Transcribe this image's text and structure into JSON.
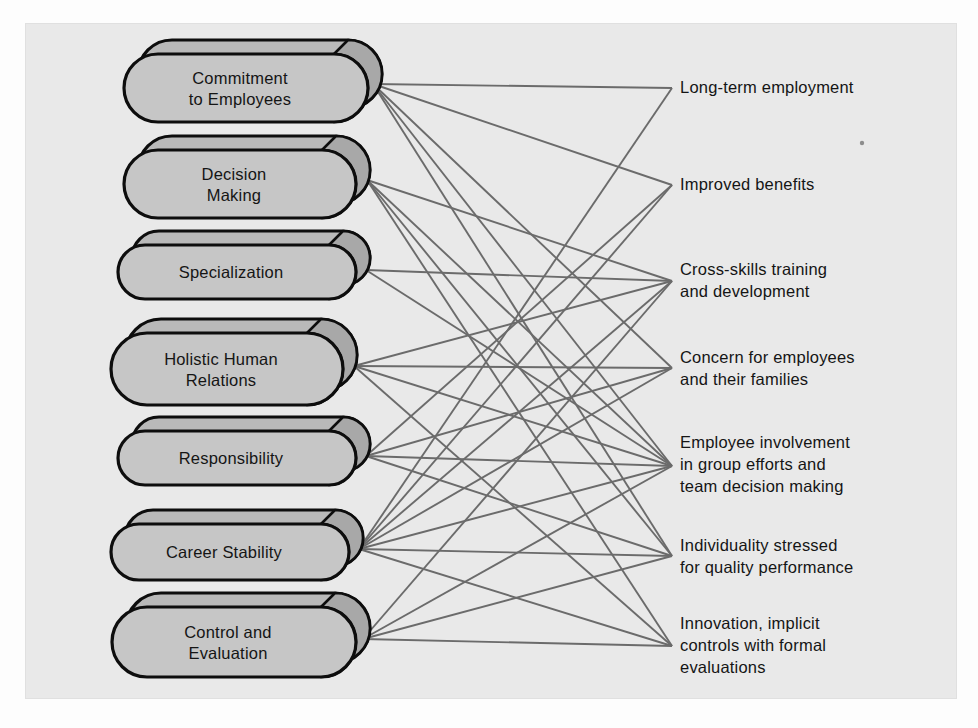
{
  "figure": {
    "panel_background": "#e9e9e9",
    "page_background": "#fdfdfd",
    "node_fill": "#c6c6c6",
    "node_back_fill": "#b9b9b9",
    "node_outline": "#0d0d0d",
    "line_color": "#6b6b6b"
  },
  "left_nodes": [
    {
      "id": "commitment-to-employees",
      "lines": [
        "Commitment",
        "to Employees"
      ],
      "cx": 246,
      "cy": 88,
      "w": 244,
      "h": 68,
      "anchor_x": 373,
      "anchor_y": 84
    },
    {
      "id": "decision-making",
      "lines": [
        "Decision",
        "Making"
      ],
      "cx": 240,
      "cy": 184,
      "w": 232,
      "h": 68,
      "anchor_x": 367,
      "anchor_y": 180
    },
    {
      "id": "specialization",
      "lines": [
        "Specialization"
      ],
      "cx": 237,
      "cy": 272,
      "w": 238,
      "h": 54,
      "anchor_x": 366,
      "anchor_y": 270
    },
    {
      "id": "holistic-human-relations",
      "lines": [
        "Holistic Human",
        "Relations"
      ],
      "cx": 227,
      "cy": 369,
      "w": 232,
      "h": 72,
      "anchor_x": 354,
      "anchor_y": 366
    },
    {
      "id": "responsibility",
      "lines": [
        "Responsibility"
      ],
      "cx": 237,
      "cy": 458,
      "w": 238,
      "h": 54,
      "anchor_x": 366,
      "anchor_y": 456
    },
    {
      "id": "career-stability",
      "lines": [
        "Career Stability"
      ],
      "cx": 230,
      "cy": 552,
      "w": 238,
      "h": 56,
      "anchor_x": 359,
      "anchor_y": 549
    },
    {
      "id": "control-and-evaluation",
      "lines": [
        "Control and",
        "Evaluation"
      ],
      "cx": 234,
      "cy": 642,
      "w": 244,
      "h": 70,
      "anchor_x": 363,
      "anchor_y": 639
    }
  ],
  "right_outcomes": [
    {
      "id": "long-term-employment",
      "lines": [
        "Long-term employment"
      ],
      "x": 680,
      "y": 93,
      "anchor_x": 672,
      "anchor_y": 88
    },
    {
      "id": "improved-benefits",
      "lines": [
        "Improved benefits"
      ],
      "x": 680,
      "y": 190,
      "anchor_x": 672,
      "anchor_y": 185
    },
    {
      "id": "cross-skills-training-and-development",
      "lines": [
        "Cross-skills training",
        "and development"
      ],
      "x": 680,
      "y": 275,
      "anchor_x": 672,
      "anchor_y": 281
    },
    {
      "id": "concern-for-employees-and-their-families",
      "lines": [
        "Concern for employees",
        "and their families"
      ],
      "x": 680,
      "y": 363,
      "anchor_x": 672,
      "anchor_y": 368
    },
    {
      "id": "employee-involvement-in-group-efforts-and-team-decision-making",
      "lines": [
        "Employee involvement",
        "in group efforts and",
        "team decision making"
      ],
      "x": 680,
      "y": 448,
      "anchor_x": 672,
      "anchor_y": 466
    },
    {
      "id": "individuality-stressed-for-quality-performance",
      "lines": [
        "Individuality stressed",
        "for quality performance"
      ],
      "x": 680,
      "y": 551,
      "anchor_x": 672,
      "anchor_y": 556
    },
    {
      "id": "innovation-implicit-controls-with-formal-evaluations",
      "lines": [
        "Innovation, implicit",
        "controls with formal",
        "evaluations"
      ],
      "x": 680,
      "y": 629,
      "anchor_x": 672,
      "anchor_y": 646
    }
  ],
  "connections": [
    {
      "from": "commitment-to-employees",
      "to": "long-term-employment"
    },
    {
      "from": "commitment-to-employees",
      "to": "improved-benefits"
    },
    {
      "from": "commitment-to-employees",
      "to": "concern-for-employees-and-their-families"
    },
    {
      "from": "commitment-to-employees",
      "to": "employee-involvement-in-group-efforts-and-team-decision-making"
    },
    {
      "from": "commitment-to-employees",
      "to": "individuality-stressed-for-quality-performance"
    },
    {
      "from": "decision-making",
      "to": "cross-skills-training-and-development"
    },
    {
      "from": "decision-making",
      "to": "employee-involvement-in-group-efforts-and-team-decision-making"
    },
    {
      "from": "decision-making",
      "to": "individuality-stressed-for-quality-performance"
    },
    {
      "from": "decision-making",
      "to": "innovation-implicit-controls-with-formal-evaluations"
    },
    {
      "from": "specialization",
      "to": "cross-skills-training-and-development"
    },
    {
      "from": "specialization",
      "to": "employee-involvement-in-group-efforts-and-team-decision-making"
    },
    {
      "from": "holistic-human-relations",
      "to": "cross-skills-training-and-development"
    },
    {
      "from": "holistic-human-relations",
      "to": "concern-for-employees-and-their-families"
    },
    {
      "from": "holistic-human-relations",
      "to": "employee-involvement-in-group-efforts-and-team-decision-making"
    },
    {
      "from": "holistic-human-relations",
      "to": "innovation-implicit-controls-with-formal-evaluations"
    },
    {
      "from": "responsibility",
      "to": "improved-benefits"
    },
    {
      "from": "responsibility",
      "to": "concern-for-employees-and-their-families"
    },
    {
      "from": "responsibility",
      "to": "employee-involvement-in-group-efforts-and-team-decision-making"
    },
    {
      "from": "responsibility",
      "to": "individuality-stressed-for-quality-performance"
    },
    {
      "from": "career-stability",
      "to": "long-term-employment"
    },
    {
      "from": "career-stability",
      "to": "improved-benefits"
    },
    {
      "from": "career-stability",
      "to": "cross-skills-training-and-development"
    },
    {
      "from": "career-stability",
      "to": "concern-for-employees-and-their-families"
    },
    {
      "from": "career-stability",
      "to": "employee-involvement-in-group-efforts-and-team-decision-making"
    },
    {
      "from": "career-stability",
      "to": "individuality-stressed-for-quality-performance"
    },
    {
      "from": "career-stability",
      "to": "innovation-implicit-controls-with-formal-evaluations"
    },
    {
      "from": "control-and-evaluation",
      "to": "cross-skills-training-and-development"
    },
    {
      "from": "control-and-evaluation",
      "to": "employee-involvement-in-group-efforts-and-team-decision-making"
    },
    {
      "from": "control-and-evaluation",
      "to": "individuality-stressed-for-quality-performance"
    },
    {
      "from": "control-and-evaluation",
      "to": "innovation-implicit-controls-with-formal-evaluations"
    }
  ],
  "speck": {
    "cx": 862,
    "cy": 143,
    "r": 2.2
  }
}
